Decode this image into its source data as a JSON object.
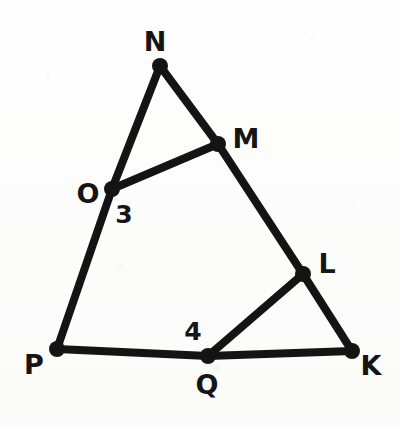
{
  "figure": {
    "background_color": "#fdfdfc",
    "ink_color": "#141414",
    "stroke_width": 8,
    "vertex_dot_radius": 8,
    "width": 400,
    "height": 428,
    "points": [
      {
        "id": "N",
        "label": "N",
        "x": 160,
        "y": 66,
        "label_x": 155,
        "label_y": 41
      },
      {
        "id": "M",
        "label": "M",
        "x": 218,
        "y": 144,
        "label_x": 246,
        "label_y": 138
      },
      {
        "id": "O",
        "label": "O",
        "x": 112,
        "y": 189,
        "label_x": 88,
        "label_y": 193
      },
      {
        "id": "L",
        "label": "L",
        "x": 303,
        "y": 274,
        "label_x": 327,
        "label_y": 263
      },
      {
        "id": "P",
        "label": "P",
        "x": 57,
        "y": 349,
        "label_x": 34,
        "label_y": 364
      },
      {
        "id": "Q",
        "label": "Q",
        "x": 208,
        "y": 356,
        "label_x": 207,
        "label_y": 384
      },
      {
        "id": "K",
        "label": "K",
        "x": 352,
        "y": 351,
        "label_x": 371,
        "label_y": 365
      }
    ],
    "segments": [
      {
        "id": "N-O",
        "from": "N",
        "to": "O"
      },
      {
        "id": "O-P",
        "from": "O",
        "to": "P"
      },
      {
        "id": "N-M",
        "from": "N",
        "to": "M"
      },
      {
        "id": "M-L",
        "from": "M",
        "to": "L"
      },
      {
        "id": "L-K",
        "from": "L",
        "to": "K"
      },
      {
        "id": "P-Q",
        "from": "P",
        "to": "Q"
      },
      {
        "id": "Q-K",
        "from": "Q",
        "to": "K"
      },
      {
        "id": "O-M",
        "from": "O",
        "to": "M"
      },
      {
        "id": "Q-L",
        "from": "Q",
        "to": "L"
      }
    ],
    "angle_marks": [
      {
        "id": "angle-3",
        "label": "3",
        "x": 124,
        "y": 214
      },
      {
        "id": "angle-4",
        "label": "4",
        "x": 193,
        "y": 331
      }
    ]
  }
}
